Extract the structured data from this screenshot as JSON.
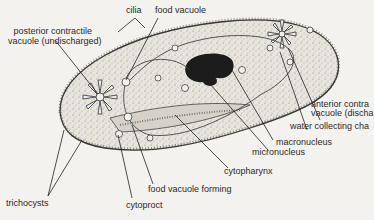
{
  "diagram": {
    "labels": {
      "cilia": "cilia",
      "food_vacuole": "food vacuole",
      "posterior_cv_line1": "posterior contractile",
      "posterior_cv_line2": "vacuole (undischarged)",
      "anterior_cv_line1": "anterior contra",
      "anterior_cv_line2": "vacuole (discha",
      "water_collecting": "water collecting cha",
      "macronucleus": "macronucleus",
      "micronucleus": "micronucleus",
      "cytopharynx": "cytopharynx",
      "food_vacuole_forming": "food vacuole forming",
      "cytoproct": "cytoproct",
      "trichocysts": "trichocysts"
    },
    "colors": {
      "background": "#f4f2ee",
      "cell_fill": "#e6e3dc",
      "outline": "#333333",
      "nucleus": "#1c1c1c"
    }
  }
}
